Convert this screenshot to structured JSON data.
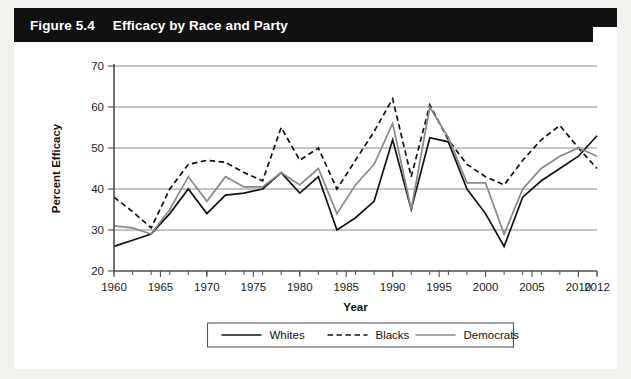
{
  "figure": {
    "number_label": "Figure 5.4",
    "caption": "Efficacy by Race and Party"
  },
  "chart_data": {
    "type": "line",
    "title": "Efficacy by Race and Party",
    "xlabel": "Year",
    "ylabel": "Percent Efficacy",
    "xlim": [
      1960,
      2012
    ],
    "ylim": [
      20,
      70
    ],
    "ytick_values": [
      20,
      30,
      40,
      50,
      60,
      70
    ],
    "ytick_labels": [
      "20",
      "30",
      "40",
      "50",
      "60",
      "70"
    ],
    "xtick_labels": [
      "1960",
      "1965",
      "1970",
      "1975",
      "1980",
      "1985",
      "1990",
      "1995",
      "2000",
      "2005",
      "2010",
      "2012"
    ],
    "xtick_values": [
      1960,
      1965,
      1970,
      1975,
      1980,
      1985,
      1990,
      1995,
      2000,
      2005,
      2010,
      2012
    ],
    "minor_tick_interval": 2,
    "grid": "horizontal",
    "legend_position": "bottom",
    "x": [
      1960,
      1962,
      1964,
      1966,
      1968,
      1970,
      1972,
      1974,
      1976,
      1978,
      1980,
      1982,
      1984,
      1986,
      1988,
      1990,
      1992,
      1994,
      1996,
      1998,
      2000,
      2002,
      2004,
      2006,
      2008,
      2010,
      2012
    ],
    "series": [
      {
        "name": "Whites",
        "style": "solid",
        "color": "#111111",
        "values": [
          26,
          27.5,
          29,
          34,
          40,
          34,
          38.5,
          39,
          40,
          44,
          39,
          43,
          30,
          33,
          37,
          52,
          35,
          52.5,
          51.5,
          40,
          34,
          26,
          38,
          42,
          45,
          48,
          53
        ]
      },
      {
        "name": "Blacks",
        "style": "dashed",
        "color": "#111111",
        "values": [
          38,
          34.5,
          30.5,
          40,
          46,
          47,
          46.5,
          44,
          42,
          55,
          47,
          50,
          40,
          47,
          54,
          62,
          43,
          60.5,
          52,
          46,
          43,
          41,
          47,
          52,
          55.5,
          50,
          45
        ]
      },
      {
        "name": "Democrats",
        "style": "solid",
        "color": "#888888",
        "values": [
          31,
          30.5,
          29,
          35,
          43,
          37,
          43,
          40.5,
          40.5,
          44,
          41,
          45,
          34,
          41,
          46,
          56,
          35,
          60,
          52.5,
          41.5,
          41.5,
          29,
          40,
          45,
          48,
          50,
          48
        ]
      }
    ],
    "legend_entries": [
      {
        "label": "Whites",
        "style": "solid",
        "color": "#111111"
      },
      {
        "label": "Blacks",
        "style": "dashed",
        "color": "#111111"
      },
      {
        "label": "Democrats",
        "style": "solid",
        "color": "#888888"
      }
    ]
  }
}
